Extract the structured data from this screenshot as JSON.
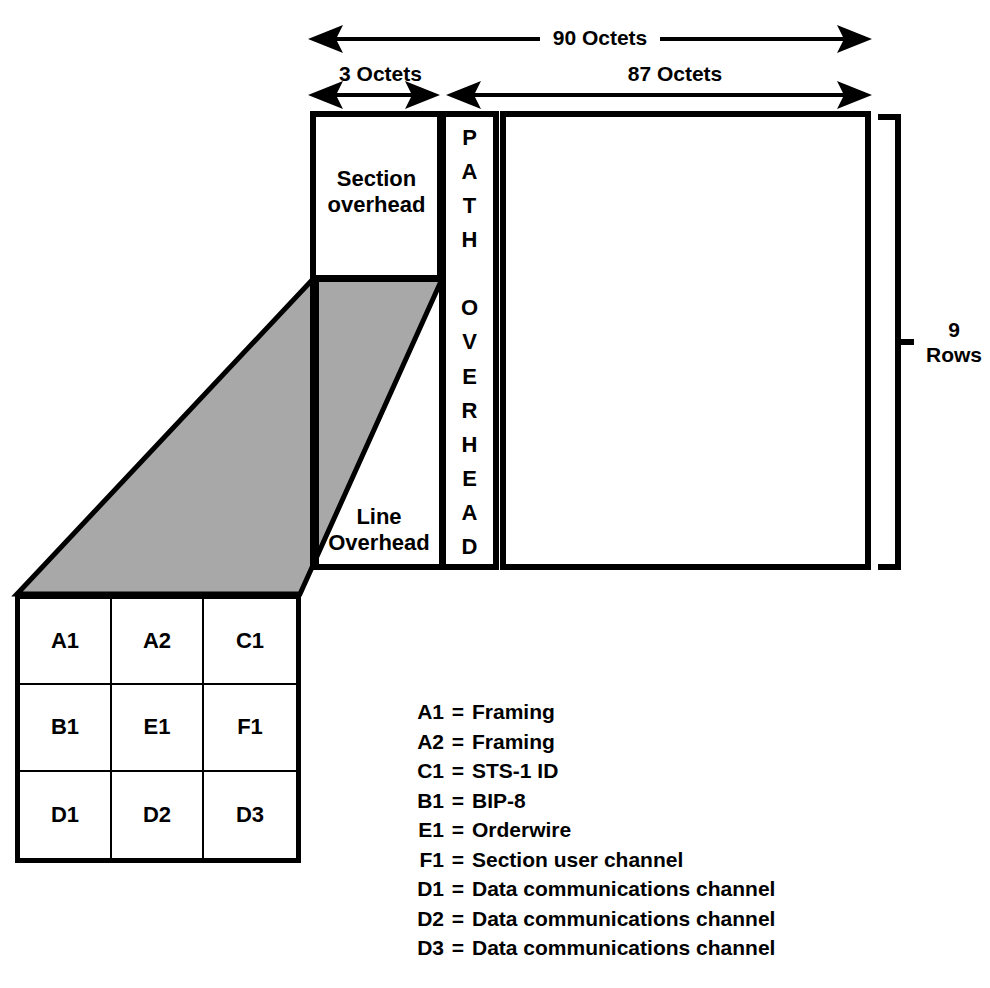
{
  "diagram": {
    "dimensions": {
      "total_width": "90 Octets",
      "overhead_width": "3 Octets",
      "payload_width": "87 Octets",
      "rows_line1": "9",
      "rows_line2": "Rows"
    },
    "blocks": {
      "section_overhead_line1": "Section",
      "section_overhead_line2": "overhead",
      "line_overhead_line1": "Line",
      "line_overhead_line2": "Overhead",
      "path_overhead_letters": [
        "P",
        "A",
        "T",
        "H",
        "",
        "O",
        "V",
        "E",
        "R",
        "H",
        "E",
        "A",
        "D"
      ],
      "path_overhead_text": "PATH OVERHEAD"
    },
    "overhead_grid": {
      "rows": [
        [
          "A1",
          "A2",
          "C1"
        ],
        [
          "B1",
          "E1",
          "F1"
        ],
        [
          "D1",
          "D2",
          "D3"
        ]
      ]
    },
    "legend": {
      "equals": "=",
      "entries": [
        {
          "code": "A1",
          "desc": "Framing"
        },
        {
          "code": "A2",
          "desc": "Framing"
        },
        {
          "code": "C1",
          "desc": "STS-1 ID"
        },
        {
          "code": "B1",
          "desc": "BIP-8"
        },
        {
          "code": "E1",
          "desc": "Orderwire"
        },
        {
          "code": "F1",
          "desc": "Section user channel"
        },
        {
          "code": "D1",
          "desc": "Data communications channel"
        },
        {
          "code": "D2",
          "desc": "Data communications channel"
        },
        {
          "code": "D3",
          "desc": "Data communications channel"
        }
      ]
    },
    "colors": {
      "stroke": "#000000",
      "shade_fill": "#a8a8a8",
      "background": "#ffffff"
    }
  }
}
